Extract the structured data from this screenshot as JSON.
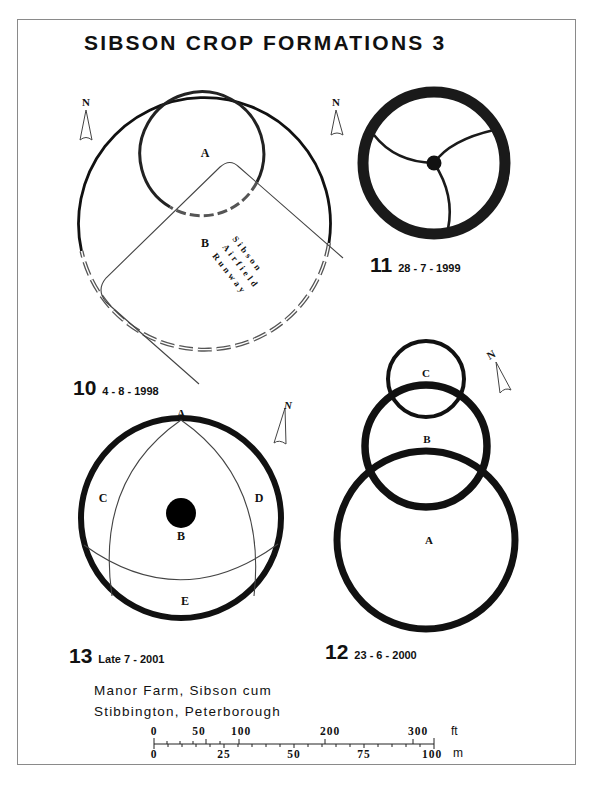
{
  "title": "SIBSON CROP FORMATIONS 3",
  "compass_label": "N",
  "formations": [
    {
      "number": "10",
      "date": "4 - 8 - 1998",
      "circle_labels": [
        "A",
        "B"
      ],
      "runway_text": [
        "Sibson",
        "Airfield",
        "Runway"
      ]
    },
    {
      "number": "11",
      "date": "28 - 7 - 1999"
    },
    {
      "number": "12",
      "date": "23 - 6 - 2000",
      "circle_labels": [
        "A",
        "B",
        "C"
      ]
    },
    {
      "number": "13",
      "date": "Late 7 - 2001",
      "circle_labels": [
        "A",
        "B",
        "C",
        "D",
        "E"
      ]
    }
  ],
  "location": {
    "line1": "Manor Farm, Sibson cum",
    "line2": "Stibbington, Peterborough"
  },
  "scale_bar": {
    "feet_ticks": [
      "0",
      "50",
      "100",
      "200",
      "300"
    ],
    "feet_unit": "ft",
    "metre_ticks": [
      "0",
      "25",
      "50",
      "75",
      "100"
    ],
    "metre_unit": "m"
  },
  "colors": {
    "ink": "#111111",
    "frame": "#8a8a8a",
    "dashed": "#555555"
  }
}
